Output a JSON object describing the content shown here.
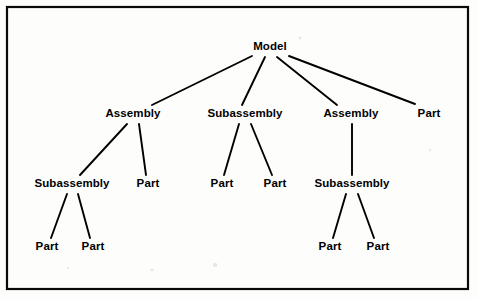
{
  "diagram": {
    "kind": "product-structure-tree",
    "frame": {
      "x": 7,
      "y": 7,
      "width": 461,
      "height": 282,
      "color": "#0a0a0a"
    },
    "colors": {
      "background": "#fdfdfc",
      "line": "#000000",
      "text": "#000000",
      "frame": "#0a0a0a"
    },
    "nodes": [
      {
        "id": "model",
        "label": "Model",
        "level": 0,
        "x": 270,
        "y": 50
      },
      {
        "id": "a1",
        "label": "Assembly",
        "level": 1,
        "x": 133,
        "y": 117
      },
      {
        "id": "s1",
        "label": "Subassembly",
        "level": 1,
        "x": 245,
        "y": 117
      },
      {
        "id": "a2",
        "label": "Assembly",
        "level": 1,
        "x": 351,
        "y": 117
      },
      {
        "id": "p0",
        "label": "Part",
        "level": 1,
        "x": 429,
        "y": 117
      },
      {
        "id": "s2",
        "label": "Subassembly",
        "level": 2,
        "x": 72,
        "y": 187
      },
      {
        "id": "p1",
        "label": "Part",
        "level": 2,
        "x": 148,
        "y": 187
      },
      {
        "id": "p2",
        "label": "Part",
        "level": 2,
        "x": 222,
        "y": 187
      },
      {
        "id": "p3",
        "label": "Part",
        "level": 2,
        "x": 275,
        "y": 187
      },
      {
        "id": "s3",
        "label": "Subassembly",
        "level": 2,
        "x": 352,
        "y": 187
      },
      {
        "id": "p4",
        "label": "Part",
        "level": 3,
        "x": 47,
        "y": 250
      },
      {
        "id": "p5",
        "label": "Part",
        "level": 3,
        "x": 93,
        "y": 250
      },
      {
        "id": "p6",
        "label": "Part",
        "level": 3,
        "x": 330,
        "y": 250
      },
      {
        "id": "p7",
        "label": "Part",
        "level": 3,
        "x": 378,
        "y": 250
      }
    ],
    "edges": [
      {
        "from": "model",
        "to": "a1",
        "x1": 252,
        "y1": 56,
        "x2": 152,
        "y2": 105
      },
      {
        "from": "model",
        "to": "s1",
        "x1": 265,
        "y1": 57,
        "x2": 242,
        "y2": 105
      },
      {
        "from": "model",
        "to": "a2",
        "x1": 277,
        "y1": 57,
        "x2": 337,
        "y2": 105
      },
      {
        "from": "model",
        "to": "p0",
        "x1": 289,
        "y1": 56,
        "x2": 415,
        "y2": 104
      },
      {
        "from": "a1",
        "to": "s2",
        "x1": 127,
        "y1": 124,
        "x2": 80,
        "y2": 175
      },
      {
        "from": "a1",
        "to": "p1",
        "x1": 139,
        "y1": 124,
        "x2": 146,
        "y2": 175
      },
      {
        "from": "s1",
        "to": "p2",
        "x1": 239,
        "y1": 124,
        "x2": 224,
        "y2": 175
      },
      {
        "from": "s1",
        "to": "p3",
        "x1": 251,
        "y1": 124,
        "x2": 272,
        "y2": 175
      },
      {
        "from": "a2",
        "to": "s3",
        "x1": 352,
        "y1": 124,
        "x2": 352,
        "y2": 175
      },
      {
        "from": "s2",
        "to": "p4",
        "x1": 67,
        "y1": 194,
        "x2": 51,
        "y2": 238
      },
      {
        "from": "s2",
        "to": "p5",
        "x1": 78,
        "y1": 194,
        "x2": 90,
        "y2": 238
      },
      {
        "from": "s3",
        "to": "p6",
        "x1": 346,
        "y1": 194,
        "x2": 333,
        "y2": 238
      },
      {
        "from": "s3",
        "to": "p7",
        "x1": 358,
        "y1": 194,
        "x2": 374,
        "y2": 238
      }
    ],
    "specks": [
      {
        "x": 215,
        "y": 265,
        "r": 2.3
      },
      {
        "x": 152,
        "y": 270,
        "r": 1.6
      },
      {
        "x": 300,
        "y": 38,
        "r": 1.4
      },
      {
        "x": 68,
        "y": 268,
        "r": 1.2
      },
      {
        "x": 430,
        "y": 150,
        "r": 1.3
      }
    ]
  }
}
